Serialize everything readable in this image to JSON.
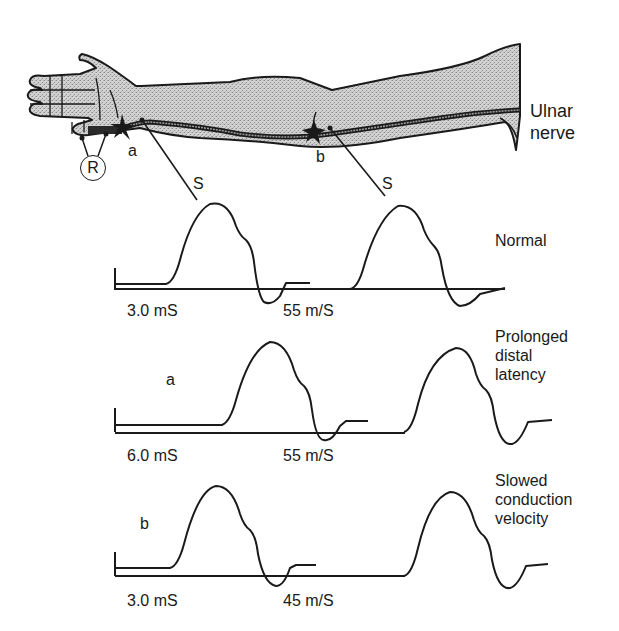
{
  "arm": {
    "nerve_label": "Ulnar\nnerve",
    "recording_electrode_label": "R",
    "stim_site_a": "a",
    "stim_site_b": "b",
    "stim_a_label": "S",
    "stim_b_label": "S"
  },
  "traces": [
    {
      "condition": "Normal",
      "row_marker": "",
      "latency_label": "3.0 mS",
      "velocity_label": "55 m/S"
    },
    {
      "condition": "Prolonged\ndistal\nlatency",
      "row_marker": "a",
      "latency_label": "6.0 mS",
      "velocity_label": "55 m/S"
    },
    {
      "condition": "Slowed\nconduction\nvelocity",
      "row_marker": "b",
      "latency_label": "3.0 mS",
      "velocity_label": "45 m/S"
    }
  ],
  "colors": {
    "ink": "#1a1a1a",
    "skin_fill": "#c4c4c4",
    "background": "#ffffff"
  }
}
